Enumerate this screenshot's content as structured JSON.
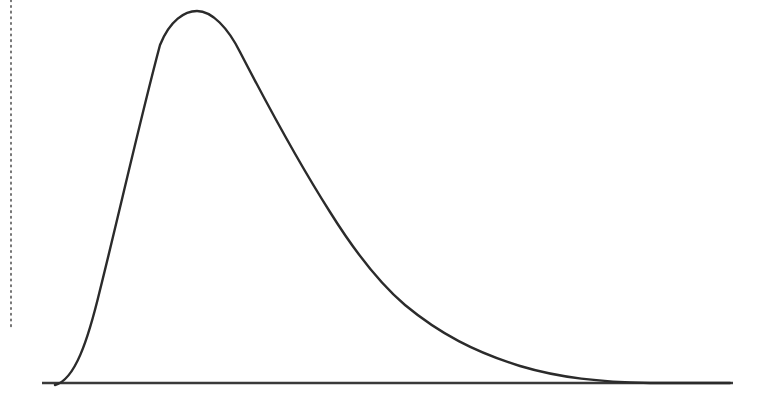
{
  "diagram": {
    "type": "distribution-curve",
    "colors": {
      "curve": "#2b2b2b",
      "baseline": "#3a3a3a",
      "dotted_line": "#555555",
      "background": "#ffffff"
    },
    "baseline": {
      "x1": 42,
      "x2": 733,
      "y": 383
    },
    "dotted_line": {
      "x": 11,
      "y1": 0,
      "y2": 330
    },
    "curve_path": "M 55 385 C 75 380, 88 340, 100 290 C 120 210, 140 120, 160 45 C 170 20, 185 11, 197 11 C 212 11, 228 28, 240 52 C 270 110, 300 165, 330 212 C 355 252, 378 282, 405 305 C 440 334, 475 352, 520 366 C 560 378, 600 382, 650 383 L 730 383"
  }
}
